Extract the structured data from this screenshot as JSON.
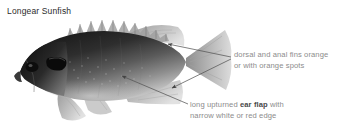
{
  "figure": {
    "title": "Longear Sunfish",
    "background_color": "#ffffff",
    "title_color": "#2b2b2b",
    "annotation_color": "#8c8c8c",
    "annotation_emphasis_color": "#4a4a4a",
    "leader_line_color": "#555555",
    "fish_body_dark": "#262626",
    "fish_body_mid": "#6f6f6f",
    "fish_fin_light": "#bdbdbd"
  },
  "annotations": [
    {
      "id": "dorsal-anal-fins",
      "line1": "dorsal and anal fins orange",
      "line2": "or with orange spots",
      "emphasis": "",
      "points_to": [
        "dorsal-fin",
        "anal-fin"
      ]
    },
    {
      "id": "ear-flap",
      "line1_pre": "long upturned ",
      "line1_bold": "ear flap",
      "line1_post": " with",
      "line2": "narrow white or red edge",
      "points_to": [
        "ear-flap"
      ]
    }
  ]
}
